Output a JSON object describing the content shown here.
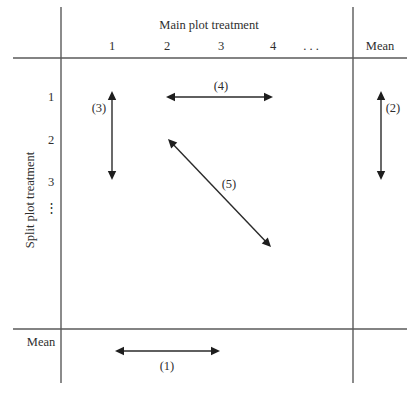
{
  "figure": {
    "column_header": "Main plot treatment",
    "row_header": "Split plot treatment",
    "columns": [
      "1",
      "2",
      "3",
      "4",
      ". . ."
    ],
    "column_mean_label": "Mean",
    "rows": [
      "1",
      "2",
      "3"
    ],
    "row_ellipsis": "⋮",
    "row_mean_label": "Mean",
    "comparisons": [
      {
        "id": "1",
        "label": "(1)",
        "description": "between main plot means (averaged over split plot treatments)"
      },
      {
        "id": "2",
        "label": "(2)",
        "description": "between split plot means (averaged over main plot treatments)"
      },
      {
        "id": "3",
        "label": "(3)",
        "description": "between split plot treatments within the same main plot treatment"
      },
      {
        "id": "4",
        "label": "(4)",
        "description": "between main plot treatments within the same split plot treatment"
      },
      {
        "id": "5",
        "label": "(5)",
        "description": "between different main plot and different split plot treatments"
      }
    ]
  }
}
